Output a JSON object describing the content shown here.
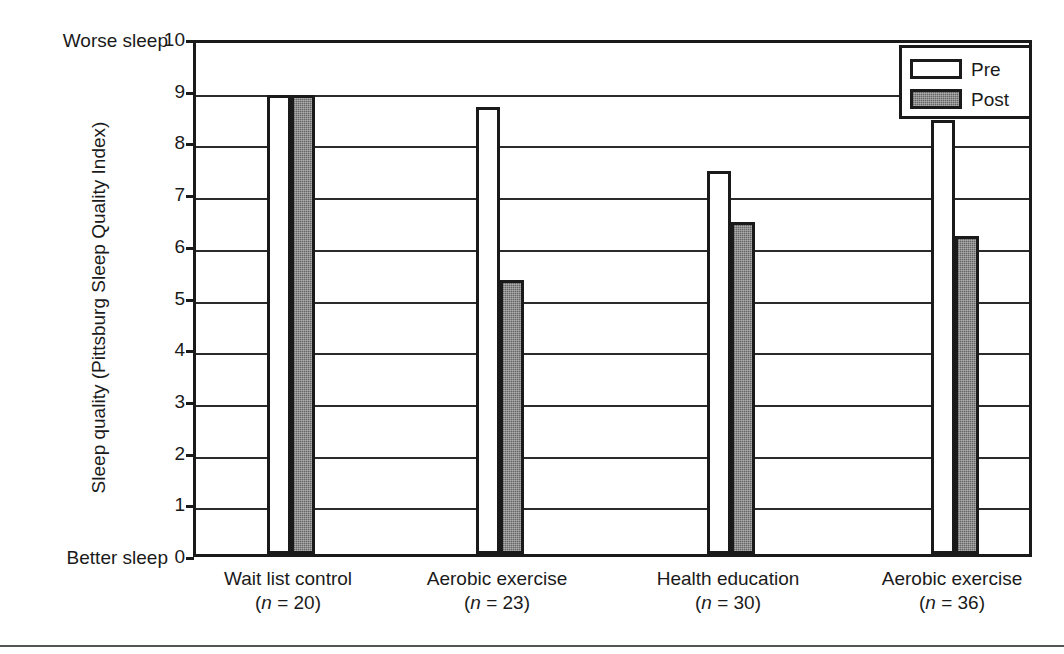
{
  "chart_data": {
    "type": "bar",
    "title": "",
    "xlabel": "",
    "ylabel": "Sleep quality (Pittsburg Sleep Quality Index)",
    "ylim": [
      0,
      10
    ],
    "ytick_step": 1,
    "yticks": [
      "10",
      "9",
      "8",
      "7",
      "6",
      "5",
      "4",
      "3",
      "2",
      "1",
      "0"
    ],
    "grid": true,
    "legend_position": "top-right",
    "axis_notes": {
      "top": "Worse sleep",
      "bottom": "Better sleep"
    },
    "categories": [
      "Wait list control",
      "Aerobic exercise",
      "Health education",
      "Aerobic exercise"
    ],
    "category_n": [
      "(n = 20)",
      "(n = 23)",
      "(n = 30)",
      "(n = 36)"
    ],
    "category_n_prefix": "(",
    "category_n_italic": "n",
    "category_n_values": [
      "= 20)",
      "= 23)",
      "= 30)",
      "= 36)"
    ],
    "series": [
      {
        "name": "Pre",
        "values": [
          8.88,
          8.65,
          7.4,
          8.4
        ]
      },
      {
        "name": "Post",
        "values": [
          8.88,
          5.3,
          6.42,
          6.15
        ]
      }
    ],
    "colors": {
      "pre_fill": "#ffffff",
      "post_fill": "#7c7c7c",
      "outline": "#1a1a1a",
      "gridline": "#2b2b2b",
      "background": "#ffffff"
    }
  },
  "legend": {
    "items": [
      {
        "label": "Pre",
        "style": "pre"
      },
      {
        "label": "Post",
        "style": "post"
      }
    ]
  }
}
